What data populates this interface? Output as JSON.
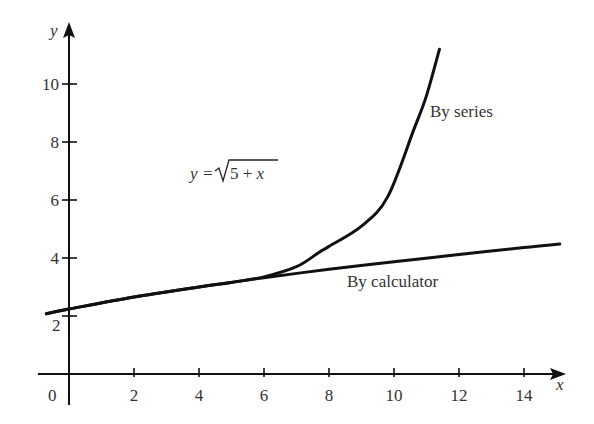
{
  "chart_data": {
    "type": "line",
    "title": "",
    "xlabel": "x",
    "ylabel": "y",
    "xlim": [
      -0.7,
      15.3
    ],
    "ylim": [
      -0.1,
      11.5
    ],
    "grid": false,
    "legend": "none (inline annotations)",
    "x_ticks": [
      2,
      4,
      6,
      8,
      10,
      12,
      14
    ],
    "y_ticks": [
      2,
      4,
      6,
      8,
      10
    ],
    "origin_label": "0",
    "equation_annotation": "y = √(5 + x)",
    "equation_parts": {
      "lhs": "y",
      "eq": "=",
      "radical": "√",
      "radicand": "5 + x"
    },
    "series": [
      {
        "name": "By calculator",
        "x": [
          -0.7,
          0,
          2,
          4,
          6,
          8,
          10,
          12,
          14,
          15.1
        ],
        "y": [
          2.08,
          2.24,
          2.65,
          3.0,
          3.32,
          3.61,
          3.87,
          4.12,
          4.36,
          4.48
        ]
      },
      {
        "name": "By series",
        "x": [
          -0.7,
          0,
          2,
          4,
          5,
          6,
          7,
          7.7,
          8,
          9,
          9.8,
          10.6,
          11,
          11.4
        ],
        "y": [
          2.08,
          2.24,
          2.65,
          3.0,
          3.16,
          3.35,
          3.7,
          4.2,
          4.4,
          5.1,
          6.1,
          8.4,
          9.6,
          11.2
        ]
      }
    ],
    "annotations": [
      {
        "text": "By series",
        "x": 11.3,
        "y": 9.5
      },
      {
        "text": "By calculator",
        "x": 8.7,
        "y": 3.0
      },
      {
        "text": "y = √(5 + x)",
        "x": 3.7,
        "y": 6.9
      }
    ]
  },
  "labels": {
    "x_axis": "x",
    "y_axis": "y",
    "origin": "0",
    "x_ticks": [
      "2",
      "4",
      "6",
      "8",
      "10",
      "12",
      "14"
    ],
    "y_ticks": [
      "2",
      "4",
      "6",
      "8",
      "10"
    ],
    "by_series": "By series",
    "by_calculator": "By calculator",
    "eq_lhs": "y",
    "eq_sign": "=",
    "eq_radicand": "5 + x"
  }
}
